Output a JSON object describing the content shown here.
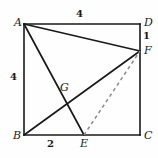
{
  "figure": {
    "background_color": "#fefefe",
    "stroke_color": "#1a1a1a",
    "dashed_stroke_color": "#8c8c8c",
    "vertices": {
      "A": {
        "label": "A",
        "x": 24,
        "y": 24,
        "label_x": 14,
        "label_y": 18
      },
      "B": {
        "label": "B",
        "x": 24,
        "y": 135,
        "label_x": 14,
        "label_y": 132
      },
      "C": {
        "label": "C",
        "x": 140,
        "y": 135,
        "label_x": 144,
        "label_y": 132
      },
      "D": {
        "label": "D",
        "x": 140,
        "y": 24,
        "label_x": 144,
        "label_y": 18
      },
      "E": {
        "label": "E",
        "x": 84,
        "y": 135,
        "label_x": 80,
        "label_y": 139
      },
      "F": {
        "label": "F",
        "x": 140,
        "y": 51,
        "label_x": 144,
        "label_y": 45
      },
      "G": {
        "label": "G",
        "x": 68,
        "y": 95,
        "label_x": 60,
        "label_y": 82
      }
    },
    "measurements": [
      {
        "name": "top-side-length",
        "value": "4",
        "x": 76,
        "y": 10
      },
      {
        "name": "left-side-length",
        "value": "4",
        "x": 10,
        "y": 72
      },
      {
        "name": "df-segment-length",
        "value": "1",
        "x": 143,
        "y": 31
      },
      {
        "name": "be-segment-length",
        "value": "2",
        "x": 47,
        "y": 139
      }
    ],
    "segments": [
      {
        "name": "side-AD",
        "from": "A",
        "to": "D",
        "style": "solid"
      },
      {
        "name": "side-AB",
        "from": "A",
        "to": "B",
        "style": "solid"
      },
      {
        "name": "side-BC",
        "from": "B",
        "to": "C",
        "style": "solid"
      },
      {
        "name": "side-DC",
        "from": "D",
        "to": "C",
        "style": "solid"
      },
      {
        "name": "segment-AF",
        "from": "A",
        "to": "F",
        "style": "solid"
      },
      {
        "name": "segment-AE",
        "from": "A",
        "to": "E",
        "style": "solid"
      },
      {
        "name": "segment-BF",
        "from": "B",
        "to": "F",
        "style": "solid"
      },
      {
        "name": "segment-EF",
        "from": "E",
        "to": "F",
        "style": "dashed"
      }
    ]
  }
}
